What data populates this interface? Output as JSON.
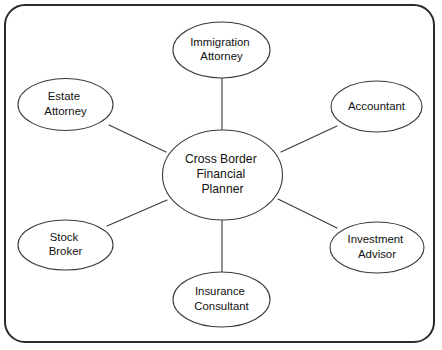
{
  "diagram": {
    "type": "hub-and-spoke",
    "frame": {
      "name": "rounded-rectangle-border",
      "x": 5,
      "y": 5,
      "width": 429,
      "height": 337,
      "corner_radius": 20,
      "stroke_color": "#2b2b2b",
      "stroke_width": 2,
      "fill_color": "#ffffff"
    },
    "style": {
      "node_fill": "#ffffff",
      "node_stroke": "#3a3a3a",
      "node_stroke_width": 1.1,
      "edge_color": "#3a3a3a",
      "edge_width": 1.1,
      "text_color": "#111111",
      "background": "#ffffff"
    },
    "hub": {
      "id": "cross-border-financial-planner",
      "lines": [
        "Cross Border",
        "Financial",
        "Planner"
      ],
      "label": "Cross Border Financial Planner",
      "cx": 222.5,
      "cy": 175,
      "rx": 60,
      "ry": 45,
      "font_size": 12.2,
      "line_height": 15
    },
    "spokes": [
      {
        "id": "immigration-attorney",
        "lines": [
          "Immigration",
          "Attorney"
        ],
        "label": "Immigration Attorney",
        "position": "top",
        "cx": 221.5,
        "cy": 50,
        "rx": 48.5,
        "ry": 28,
        "font_size": 11.4,
        "line_height": 14.5,
        "edge": {
          "x1": 222,
          "y1": 78,
          "x2": 222,
          "y2": 130
        }
      },
      {
        "id": "accountant",
        "lines": [
          "Accountant"
        ],
        "label": "Accountant",
        "position": "upper-right",
        "cx": 376.5,
        "cy": 106.5,
        "rx": 45.5,
        "ry": 25.5,
        "font_size": 11.4,
        "line_height": 14.5,
        "edge": {
          "x1": 281,
          "y1": 152,
          "x2": 337,
          "y2": 126
        }
      },
      {
        "id": "investment-advisor",
        "lines": [
          "Investment",
          "Advisor"
        ],
        "label": "Investment Advisor",
        "position": "lower-right",
        "cx": 377,
        "cy": 247.5,
        "rx": 47,
        "ry": 25.5,
        "font_size": 11.4,
        "line_height": 14.5,
        "edge": {
          "x1": 278,
          "y1": 199,
          "x2": 337,
          "y2": 228
        }
      },
      {
        "id": "insurance-consultant",
        "lines": [
          "Insurance",
          "Consultant"
        ],
        "label": "Insurance Consultant",
        "position": "bottom",
        "cx": 221.5,
        "cy": 299.5,
        "rx": 48.5,
        "ry": 27.5,
        "font_size": 11.4,
        "line_height": 14.5,
        "edge": {
          "x1": 222,
          "y1": 220,
          "x2": 222,
          "y2": 272
        }
      },
      {
        "id": "stock-broker",
        "lines": [
          "Stock",
          "Broker"
        ],
        "label": "Stock Broker",
        "position": "lower-left",
        "cx": 65.5,
        "cy": 245,
        "rx": 47.5,
        "ry": 25,
        "font_size": 11.4,
        "line_height": 14.5,
        "edge": {
          "x1": 167,
          "y1": 200,
          "x2": 107,
          "y2": 226
        }
      },
      {
        "id": "estate-attorney",
        "lines": [
          "Estate",
          "Attorney"
        ],
        "label": "Estate Attorney",
        "position": "upper-left",
        "cx": 65.5,
        "cy": 104.5,
        "rx": 47.5,
        "ry": 26,
        "font_size": 11.4,
        "line_height": 14.5,
        "edge": {
          "x1": 109,
          "y1": 125,
          "x2": 166,
          "y2": 152
        }
      }
    ]
  }
}
